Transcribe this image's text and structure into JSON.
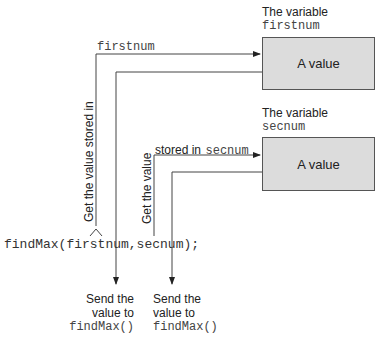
{
  "variables": [
    {
      "caption": "The variable",
      "name": "firstnum",
      "content": "A value"
    },
    {
      "caption": "The variable",
      "name": "secnum",
      "content": "A value"
    }
  ],
  "arrows": {
    "first_get_label": "Get the value stored in",
    "first_var_label": "firstnum",
    "second_get_label": "Get the value",
    "second_stored_label": "stored in",
    "second_var_label": "secnum"
  },
  "call": {
    "code": "findMax(firstnum,secnum);"
  },
  "sends": [
    {
      "line1": "Send the",
      "line2": "value to",
      "func": "findMax()"
    },
    {
      "line1": "Send the",
      "line2": "value to",
      "func": "findMax()"
    }
  ]
}
